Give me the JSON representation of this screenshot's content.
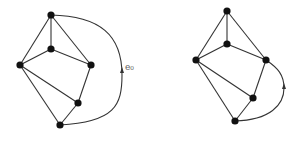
{
  "diagram": {
    "colors": {
      "edge": "#333333",
      "node": "#111111",
      "label": "#666666",
      "background": "#ffffff"
    },
    "graphs": [
      {
        "id": "left",
        "nodes": [
          {
            "id": "a",
            "x": 51,
            "y": 15
          },
          {
            "id": "b",
            "x": 51,
            "y": 49
          },
          {
            "id": "c",
            "x": 20,
            "y": 65
          },
          {
            "id": "d",
            "x": 91,
            "y": 65
          },
          {
            "id": "e",
            "x": 78,
            "y": 103
          },
          {
            "id": "f",
            "x": 60,
            "y": 125
          }
        ],
        "edges": [
          [
            "a",
            "b"
          ],
          [
            "a",
            "c"
          ],
          [
            "a",
            "d"
          ],
          [
            "b",
            "c"
          ],
          [
            "b",
            "d"
          ],
          [
            "c",
            "e"
          ],
          [
            "c",
            "f"
          ],
          [
            "d",
            "e"
          ],
          [
            "e",
            "f"
          ]
        ],
        "curved_edge": {
          "from": "f",
          "to": "a",
          "label": "e₀",
          "direction": "upward arrow"
        }
      },
      {
        "id": "right",
        "nodes": [
          {
            "id": "a",
            "x": 227,
            "y": 11
          },
          {
            "id": "b",
            "x": 227,
            "y": 44
          },
          {
            "id": "c",
            "x": 196,
            "y": 60
          },
          {
            "id": "d",
            "x": 266,
            "y": 60
          },
          {
            "id": "e",
            "x": 253,
            "y": 98
          },
          {
            "id": "f",
            "x": 235,
            "y": 121
          }
        ],
        "edges": [
          [
            "a",
            "b"
          ],
          [
            "a",
            "c"
          ],
          [
            "a",
            "d"
          ],
          [
            "b",
            "c"
          ],
          [
            "b",
            "d"
          ],
          [
            "c",
            "e"
          ],
          [
            "c",
            "f"
          ],
          [
            "d",
            "e"
          ],
          [
            "e",
            "f"
          ]
        ],
        "curved_edge": {
          "from": "f",
          "to": "d",
          "label": "",
          "direction": "upward arrow"
        }
      }
    ],
    "labels": {
      "edge_label": "e₀"
    }
  }
}
